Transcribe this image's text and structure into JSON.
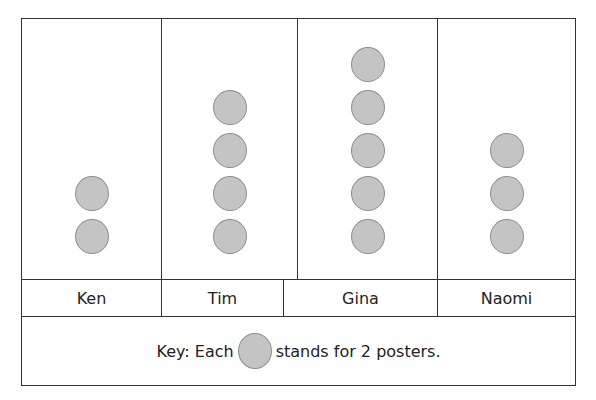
{
  "chart_data": {
    "type": "pictograph",
    "title": "",
    "categories": [
      "Ken",
      "Tim",
      "Gina",
      "Naomi"
    ],
    "symbol_counts": [
      2,
      4,
      5,
      3
    ],
    "values": [
      4,
      8,
      10,
      6
    ],
    "unit": "posters",
    "symbol": "gray-circle",
    "symbol_value": 2,
    "key_text": "Key: Each [circle] stands for 2 posters.",
    "grid": true,
    "legend_position": "bottom",
    "colors": {
      "symbol_fill": "#c4c4c4",
      "symbol_stroke": "#8f8f8f",
      "lines": "#333333"
    }
  },
  "columns": [
    {
      "name": "Ken",
      "circles": 2
    },
    {
      "name": "Tim",
      "circles": 4
    },
    {
      "name": "Gina",
      "circles": 5
    },
    {
      "name": "Naomi",
      "circles": 3
    }
  ],
  "key": {
    "prefix": "Key: Each",
    "suffix": "stands for 2 posters."
  }
}
